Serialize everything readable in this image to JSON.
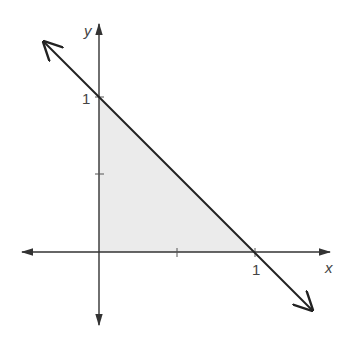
{
  "figure": {
    "colors": {
      "axis": "#333333",
      "line": "#222222",
      "fill": "#ebebeb",
      "text": "#444444"
    },
    "axes": {
      "x_label": "x",
      "y_label": "y",
      "x_tick_label": "1",
      "y_tick_label": "1"
    },
    "line": {
      "equation": "x + y = 1",
      "intercepts": [
        [
          1,
          0
        ],
        [
          0,
          1
        ]
      ]
    },
    "region": {
      "vertices": [
        [
          0,
          0
        ],
        [
          1,
          0
        ],
        [
          0,
          1
        ]
      ],
      "shaded": true
    },
    "ticks": {
      "x": [
        0.5,
        1
      ],
      "y": [
        0.5,
        1
      ]
    }
  }
}
